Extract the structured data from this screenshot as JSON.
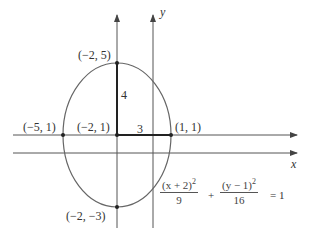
{
  "diagram": {
    "type": "ellipse-graph",
    "axes": {
      "x_label": "x",
      "y_label": "y"
    },
    "ellipse": {
      "center": "(−2, 1)",
      "semi_major": 4,
      "semi_minor": 3,
      "stroke": "#555555"
    },
    "points": {
      "top": "(−2, 5)",
      "bottom": "(−2, −3)",
      "left": "(−5, 1)",
      "right": "(1, 1)",
      "center": "(−2, 1)"
    },
    "segment_labels": {
      "vertical": "4",
      "horizontal": "3"
    },
    "equation": {
      "term1_num": "(x + 2)",
      "term1_den": "9",
      "plus": "+",
      "term2_num": "(y − 1)",
      "term2_den": "16",
      "exp": "2",
      "rhs": "= 1"
    }
  }
}
